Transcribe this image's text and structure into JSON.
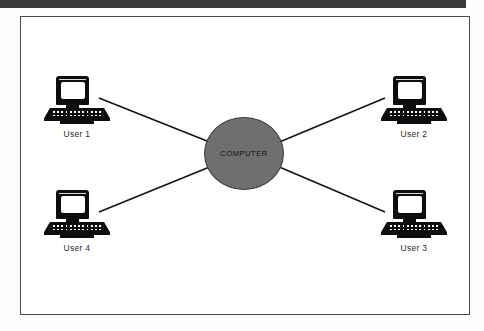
{
  "figure": {
    "type": "star-network-topology",
    "hub": {
      "label": "COMPUTER",
      "shape": "circle",
      "fill_color": "#6f6f6f",
      "stroke_color": "#3c3c3c"
    },
    "nodes": [
      {
        "id": "user-1",
        "label": "User 1",
        "icon": "desktop-computer-icon",
        "position": "top-left"
      },
      {
        "id": "user-2",
        "label": "User 2",
        "icon": "desktop-computer-icon",
        "position": "top-right"
      },
      {
        "id": "user-3",
        "label": "User 3",
        "icon": "desktop-computer-icon",
        "position": "bottom-right"
      },
      {
        "id": "user-4",
        "label": "User 4",
        "icon": "desktop-computer-icon",
        "position": "bottom-left"
      }
    ],
    "links": [
      {
        "from": "user-1",
        "to": "hub"
      },
      {
        "from": "user-2",
        "to": "hub"
      },
      {
        "from": "user-3",
        "to": "hub"
      },
      {
        "from": "user-4",
        "to": "hub"
      }
    ],
    "frame": {
      "border_color": "#4a4a4a",
      "background_color": "#ffffff"
    },
    "scan_bar_color": "#3b3b3b",
    "line_color": "#111111"
  }
}
